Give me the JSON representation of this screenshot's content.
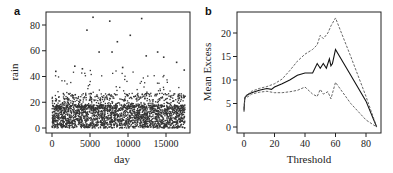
{
  "chart_data": [
    {
      "panel": "a",
      "type": "scatter",
      "title": "",
      "xlabel": "day",
      "ylabel": "rain",
      "xlim": [
        0,
        17500
      ],
      "ylim": [
        0,
        88
      ],
      "xticks": [
        0,
        5000,
        10000,
        15000
      ],
      "yticks": [
        0,
        20,
        40,
        60,
        80
      ],
      "grid": false,
      "legend": null,
      "description": "Daily rainfall for ~17500 days; dense mass from 0 to ~20, scattered points up to ~86",
      "notable_points": [
        {
          "x": 4600,
          "y": 76
        },
        {
          "x": 5400,
          "y": 86
        },
        {
          "x": 7600,
          "y": 83
        },
        {
          "x": 11800,
          "y": 85
        },
        {
          "x": 10300,
          "y": 72
        },
        {
          "x": 8600,
          "y": 67
        },
        {
          "x": 6200,
          "y": 59
        },
        {
          "x": 7900,
          "y": 59
        },
        {
          "x": 13900,
          "y": 59
        },
        {
          "x": 12400,
          "y": 56
        },
        {
          "x": 14700,
          "y": 55
        },
        {
          "x": 16400,
          "y": 51
        },
        {
          "x": 3000,
          "y": 48
        },
        {
          "x": 9300,
          "y": 47
        },
        {
          "x": 17400,
          "y": 45
        },
        {
          "x": 500,
          "y": 44
        },
        {
          "x": 4000,
          "y": 46
        }
      ]
    },
    {
      "panel": "b",
      "type": "line",
      "title": "",
      "xlabel": "Threshold",
      "ylabel": "Mean Excess",
      "xlim": [
        0,
        88
      ],
      "ylim": [
        0,
        23
      ],
      "xticks": [
        0,
        20,
        40,
        60,
        80
      ],
      "yticks": [
        0,
        5,
        10,
        15,
        20
      ],
      "grid": false,
      "legend": null,
      "series": [
        {
          "name": "mean excess",
          "style": "solid",
          "x": [
            0,
            0.5,
            2,
            5,
            10,
            15,
            18,
            20,
            25,
            30,
            35,
            40,
            45,
            48,
            50,
            52,
            54,
            56,
            57,
            58,
            60,
            70,
            80,
            87
          ],
          "y": [
            3.5,
            6.2,
            6.8,
            7.3,
            7.8,
            8.2,
            8.0,
            8.5,
            9.2,
            10.0,
            11.0,
            11.5,
            11.5,
            13.5,
            12.5,
            13.5,
            12.5,
            14.5,
            13.0,
            13.5,
            16.5,
            11.0,
            5.5,
            0
          ]
        },
        {
          "name": "upper 95% CI",
          "style": "dashed",
          "x": [
            0,
            0.5,
            5,
            10,
            15,
            20,
            25,
            30,
            35,
            40,
            45,
            48,
            50,
            52,
            55,
            57,
            60,
            70,
            80,
            87
          ],
          "y": [
            3.8,
            6.4,
            7.6,
            8.2,
            8.6,
            9.2,
            10.2,
            12.0,
            14.0,
            15.5,
            16.5,
            17.5,
            19.5,
            18.8,
            20.0,
            21.5,
            23.2,
            15.0,
            6.5,
            0
          ]
        },
        {
          "name": "lower 95% CI",
          "style": "dashed",
          "x": [
            0,
            0.5,
            5,
            10,
            15,
            20,
            25,
            30,
            35,
            40,
            45,
            48,
            50,
            52,
            55,
            57,
            60,
            70,
            80,
            87
          ],
          "y": [
            3.2,
            6.0,
            7.0,
            7.4,
            7.6,
            7.3,
            7.3,
            7.5,
            7.8,
            8.5,
            7.0,
            6.5,
            8.0,
            7.0,
            7.5,
            6.0,
            9.5,
            5.0,
            1.5,
            0
          ]
        }
      ]
    }
  ],
  "panels": {
    "a": {
      "label": "a",
      "xlabel": "day",
      "ylabel": "rain",
      "xticks": [
        "0",
        "5000",
        "10000",
        "15000"
      ],
      "yticks": [
        "0",
        "20",
        "40",
        "60",
        "80"
      ]
    },
    "b": {
      "label": "b",
      "xlabel": "Threshold",
      "ylabel": "Mean Excess",
      "xticks": [
        "0",
        "20",
        "40",
        "60",
        "80"
      ],
      "yticks": [
        "0",
        "5",
        "10",
        "15",
        "20"
      ]
    }
  }
}
